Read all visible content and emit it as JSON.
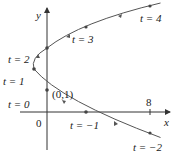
{
  "diagram": {
    "type": "parametric-curve",
    "axes": {
      "x_label": "x",
      "y_label": "y",
      "origin_label": "0",
      "x_tick_label": "8"
    },
    "point_label": "(0,1)",
    "param_labels": {
      "t4": "t = 4",
      "t3": "t = 3",
      "t2": "t = 2",
      "t1": "t = 1",
      "t0": "t = 0",
      "tm1": "t = −1",
      "tm2": "t = −2"
    },
    "points": [
      {
        "t": -2,
        "x": 8,
        "y": -1
      },
      {
        "t": -1,
        "x": 3,
        "y": 0
      },
      {
        "t": 0,
        "x": 0,
        "y": 1
      },
      {
        "t": 1,
        "x": -1,
        "y": 2
      },
      {
        "t": 2,
        "x": 0,
        "y": 3
      },
      {
        "t": 3,
        "x": 3,
        "y": 4
      },
      {
        "t": 4,
        "x": 8,
        "y": 5
      }
    ],
    "colors": {
      "curve": "#555555",
      "axis": "#333333"
    }
  }
}
